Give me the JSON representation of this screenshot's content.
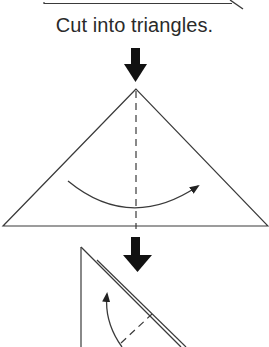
{
  "diagram": {
    "type": "origami-instructions",
    "caption": "Cut into triangles.",
    "colors": {
      "line": "#3a3a3a",
      "arrow_fill": "#111111",
      "text": "#2a2a2a",
      "background": "#ffffff"
    },
    "steps": [
      {
        "id": "previous-step-paper",
        "description": "Bottom edge of rectangular sheet with cut line at right"
      },
      {
        "id": "triangle-step",
        "description": "Large triangle with vertical dashed fold line and curved arrow indicating fold left-to-right"
      },
      {
        "id": "folded-triangle-step",
        "description": "Half-triangle folded with double edge, dashed fold line and curved arrow indicating upward fold"
      }
    ],
    "arrows": [
      {
        "id": "step-arrow-1",
        "direction": "down"
      },
      {
        "id": "step-arrow-2",
        "direction": "down"
      }
    ]
  }
}
